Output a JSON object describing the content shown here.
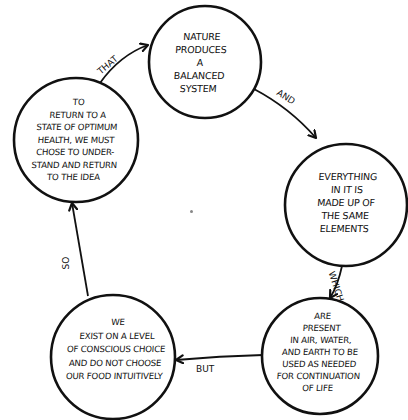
{
  "diagram": {
    "type": "cycle",
    "nodes": [
      {
        "id": "n1",
        "text": "Nature\nproduces\na\nbalanced\nsystem"
      },
      {
        "id": "n2",
        "text": "Everything\nin it is\nmade up of\nthe same\nelements"
      },
      {
        "id": "n3",
        "text": "Are\npresent\nin air, water,\nand earth to be\nused as needed\nfor continuation\nof life"
      },
      {
        "id": "n4",
        "text": "We\nexist on a level\nof conscious choice\nand do not choose\nour food intuitively"
      },
      {
        "id": "n5",
        "text": "To\nreturn to a\nstate of optimum\nhealth, we must\nchose to under-\nstand and return\nto the idea"
      }
    ],
    "edges": [
      {
        "from": "n1",
        "to": "n2",
        "label": "and"
      },
      {
        "from": "n2",
        "to": "n3",
        "label": "which"
      },
      {
        "from": "n3",
        "to": "n4",
        "label": "but"
      },
      {
        "from": "n4",
        "to": "n5",
        "label": "so"
      },
      {
        "from": "n5",
        "to": "n1",
        "label": "that"
      }
    ],
    "colors": {
      "stroke": "#111111",
      "background": "#ffffff"
    }
  }
}
